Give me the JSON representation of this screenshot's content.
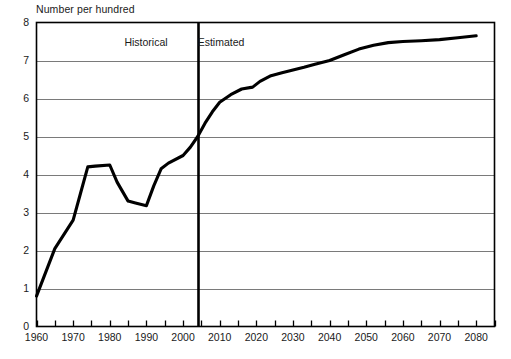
{
  "chart_data": {
    "type": "line",
    "title": "Number per hundred",
    "xlabel": "",
    "ylabel": "Number per hundred",
    "ylim": [
      0,
      8
    ],
    "xlim": [
      1960,
      2085
    ],
    "ytick_step": 1,
    "xtick_step": 5,
    "xtick_label_step": 10,
    "grid": "horizontal",
    "legend": "none",
    "yticks": [
      "0",
      "1",
      "2",
      "3",
      "4",
      "5",
      "6",
      "7",
      "8"
    ],
    "xticks": [
      "1960",
      "1970",
      "1980",
      "1990",
      "2000",
      "2010",
      "2020",
      "2030",
      "2040",
      "2050",
      "2060",
      "2070",
      "2080"
    ],
    "xticks_minor": [
      1965,
      1975,
      1985,
      1995,
      2005,
      2015,
      2025,
      2035,
      2045,
      2055,
      2065,
      2075,
      2085
    ],
    "annotations": [
      {
        "name": "historical-label",
        "text": "Historical",
        "x": 1990,
        "y": 7.45
      },
      {
        "name": "estimated-label",
        "text": "Estimated",
        "x": 2010,
        "y": 7.45
      },
      {
        "name": "divider-line",
        "text": "",
        "x": 2004,
        "y": null
      }
    ],
    "divider_year": 2004,
    "series": [
      {
        "name": "Number per hundred",
        "color": "#000000",
        "x": [
          1960,
          1965,
          1970,
          1972,
          1974,
          1976,
          1980,
          1982,
          1985,
          1987,
          1990,
          1992,
          1994,
          1996,
          2000,
          2002,
          2004,
          2006,
          2008,
          2010,
          2013,
          2016,
          2019,
          2021,
          2024,
          2027,
          2030,
          2033,
          2036,
          2040,
          2044,
          2048,
          2052,
          2056,
          2060,
          2065,
          2070,
          2075,
          2080
        ],
        "values": [
          0.8,
          2.05,
          2.8,
          3.5,
          4.2,
          4.22,
          4.25,
          3.8,
          3.3,
          3.25,
          3.18,
          3.7,
          4.15,
          4.3,
          4.5,
          4.72,
          5.0,
          5.35,
          5.65,
          5.9,
          6.1,
          6.25,
          6.3,
          6.45,
          6.6,
          6.68,
          6.75,
          6.82,
          6.9,
          7.0,
          7.15,
          7.3,
          7.4,
          7.47,
          7.5,
          7.52,
          7.55,
          7.6,
          7.65
        ]
      }
    ]
  },
  "style": {
    "axis_color": "#000000",
    "grid_color": "#7a7a7a",
    "line_color": "#000000",
    "background": "#ffffff"
  }
}
